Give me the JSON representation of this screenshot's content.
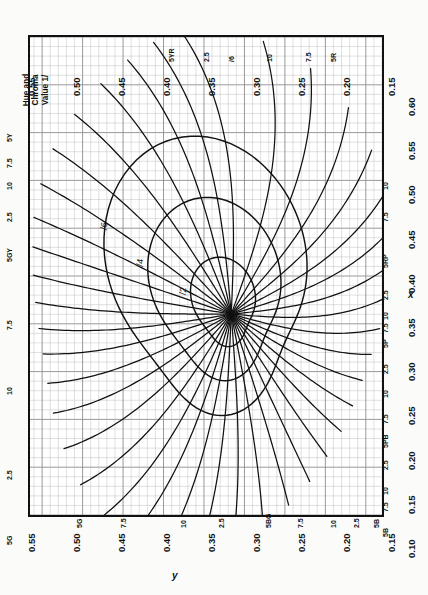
{
  "figure": {
    "title": "Hue and Chroma\nValue 1/",
    "x_axis_name": "x",
    "y_axis_name": "y",
    "x_ticks": [
      "0.10",
      "0.15",
      "0.20",
      "0.25",
      "0.30",
      "0.35",
      "0.40",
      "0.45",
      "0.50",
      "0.55",
      "0.60"
    ],
    "y_ticks": [
      "0.15",
      "0.20",
      "0.25",
      "0.30",
      "0.35",
      "0.40",
      "0.45",
      "0.50",
      "0.55"
    ],
    "background": "#ffffff",
    "line_color": "#111111",
    "grid_color": "#8d8d8d",
    "minor_grid_color": "#b9b9b9",
    "border_color": "#111111"
  },
  "chart_data": {
    "type": "line",
    "title": "Hue and Chroma Value 1/",
    "xlabel": "x",
    "ylabel": "y",
    "xlim": [
      0.1,
      0.6
    ],
    "ylim": [
      0.13,
      0.565
    ],
    "grid": true,
    "legend": "none",
    "neutral_point": {
      "x": 0.3101,
      "y": 0.3163
    },
    "hue_lines": [
      {
        "name": "5R",
        "label": "5R",
        "edge": "x-top",
        "at": 0.556
      },
      {
        "name": "7.5R",
        "label": "7.5",
        "edge": "x-top",
        "at": 0.589
      },
      {
        "name": "10R",
        "label": "10",
        "edge": "x-top",
        "at": 0.583
      },
      {
        "name": "2.5YR",
        "label": "2.5",
        "edge": "x-top",
        "at": 0.56
      },
      {
        "name": "5YR",
        "label": "5YR",
        "edge": "x-top",
        "at": 0.53
      },
      {
        "name": "7.5YR",
        "label": "7.5",
        "edge": "y-left",
        "at": 0.512
      },
      {
        "name": "10YR",
        "label": "10",
        "edge": "y-left",
        "at": 0.524
      },
      {
        "name": "2.5Y",
        "label": "2.5",
        "edge": "y-left",
        "at": 0.53
      },
      {
        "name": "5Y",
        "label": "5Y",
        "edge": "y-left",
        "at": 0.521
      },
      {
        "name": "7.5Y",
        "label": "7.5",
        "edge": "y-left",
        "at": 0.505
      },
      {
        "name": "10Y",
        "label": "10",
        "edge": "y-left",
        "at": 0.487
      },
      {
        "name": "2.5GY",
        "label": "2.5",
        "edge": "y-left",
        "at": 0.47
      },
      {
        "name": "5GY",
        "label": "5GY",
        "edge": "y-left",
        "at": 0.452
      },
      {
        "name": "7.5GY",
        "label": "7.5",
        "edge": "y-left",
        "at": 0.43
      },
      {
        "name": "10GY",
        "label": "10",
        "edge": "y-left",
        "at": 0.402
      },
      {
        "name": "2.5G",
        "label": "2.5",
        "edge": "y-left",
        "at": 0.372
      },
      {
        "name": "5G",
        "label": "5G",
        "edge": "y-bottom",
        "at": 0.345
      },
      {
        "name": "7.5G",
        "label": "7.5",
        "edge": "y-bottom",
        "at": 0.33
      },
      {
        "name": "10G",
        "label": "10",
        "edge": "y-bottom",
        "at": 0.316
      },
      {
        "name": "2.5BG",
        "label": "2.5",
        "edge": "y-bottom",
        "at": 0.303
      },
      {
        "name": "5BG",
        "label": "5BG",
        "edge": "y-bottom",
        "at": 0.288
      },
      {
        "name": "7.5BG",
        "label": "7.5",
        "edge": "y-bottom",
        "at": 0.268
      },
      {
        "name": "10BG",
        "label": "10",
        "edge": "y-bottom",
        "at": 0.248
      },
      {
        "name": "2.5B",
        "label": "2.5",
        "edge": "y-bottom",
        "at": 0.222
      },
      {
        "name": "5B",
        "label": "5B",
        "edge": "y-bottom",
        "at": 0.196
      },
      {
        "name": "7.5B",
        "label": "7.5",
        "edge": "x-right",
        "at": 0.15
      },
      {
        "name": "10B",
        "label": "10",
        "edge": "x-right",
        "at": 0.163
      },
      {
        "name": "2.5PB",
        "label": "2.5",
        "edge": "x-right",
        "at": 0.18
      },
      {
        "name": "5PB",
        "label": "5PB",
        "edge": "x-right",
        "at": 0.2
      },
      {
        "name": "7.5PB",
        "label": "7.5",
        "edge": "x-right",
        "at": 0.222
      },
      {
        "name": "10PB",
        "label": "10",
        "edge": "x-right",
        "at": 0.25
      },
      {
        "name": "2.5P",
        "label": "2.5",
        "edge": "x-right",
        "at": 0.277
      },
      {
        "name": "5P",
        "label": "5P",
        "edge": "x-right",
        "at": 0.3
      },
      {
        "name": "7.5P",
        "label": "7.5",
        "edge": "x-right",
        "at": 0.313
      },
      {
        "name": "10P",
        "label": "10",
        "edge": "x-right",
        "at": 0.327
      },
      {
        "name": "2.5RP",
        "label": "2.5",
        "edge": "x-right",
        "at": 0.352
      },
      {
        "name": "5RP",
        "label": "5RP",
        "edge": "x-right",
        "at": 0.385
      },
      {
        "name": "7.5RP",
        "label": "7.5",
        "edge": "x-right",
        "at": 0.42
      },
      {
        "name": "10RP",
        "label": "10",
        "edge": "x-right",
        "at": 0.455
      }
    ],
    "chroma_contours": [
      {
        "name": "/2",
        "label": "/2"
      },
      {
        "name": "/4",
        "label": "/4"
      },
      {
        "name": "/6",
        "label": "/6"
      }
    ]
  },
  "labels": {
    "edge_top": [
      "5YR",
      "2.5",
      "/6",
      "10",
      "7.5",
      "5R"
    ],
    "edge_left": [
      "5Y",
      "7.5",
      "10",
      "2.5",
      "5GY",
      "7.5",
      "10",
      "2.5",
      "5G"
    ],
    "edge_bottom": [
      "5G",
      "7.5",
      "10",
      "2.5",
      "5BG",
      "7.5",
      "10",
      "2.5",
      "5B"
    ],
    "edge_right": [
      "5B",
      "7.5",
      "10",
      "2.5",
      "5PB",
      "7.5",
      "10",
      "2.5",
      "5P",
      "7.5",
      "10",
      "2.5",
      "5RP",
      "7.5",
      "10"
    ],
    "chroma": [
      "/2",
      "/4",
      "/6"
    ]
  }
}
